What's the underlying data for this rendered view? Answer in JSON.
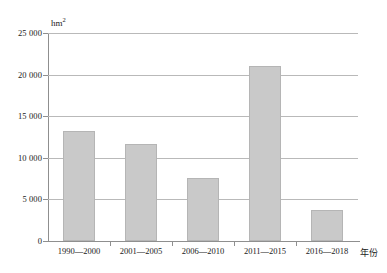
{
  "chart_data": {
    "type": "bar",
    "title": "",
    "subtitle": "",
    "xlabel": "年份",
    "ylabel": "hm²",
    "unit_label": "hm",
    "unit_superscript": "2",
    "categories": [
      "1990—2000",
      "2001—2005",
      "2006—2010",
      "2011—2015",
      "2016—2018"
    ],
    "values": [
      13200,
      11700,
      7600,
      21000,
      3700
    ],
    "ylim": [
      0,
      25000
    ],
    "ytick_values": [
      0,
      5000,
      10000,
      15000,
      20000,
      25000
    ],
    "ytick_labels": [
      "0",
      "5 000",
      "10 000",
      "15 000",
      "20 000",
      "25 000"
    ],
    "grid": true,
    "legend": "none",
    "series": [
      {
        "name": "",
        "values": [
          13200,
          11700,
          7600,
          21000,
          3700
        ]
      }
    ],
    "colors": {
      "bar_fill": "#c9c9c9",
      "bar_border": "#b5b5b5",
      "gridline": "#b9b9b9",
      "axis": "#8f8f8f",
      "text": "#1a1a1a"
    }
  },
  "caption": {
    "text": ""
  }
}
